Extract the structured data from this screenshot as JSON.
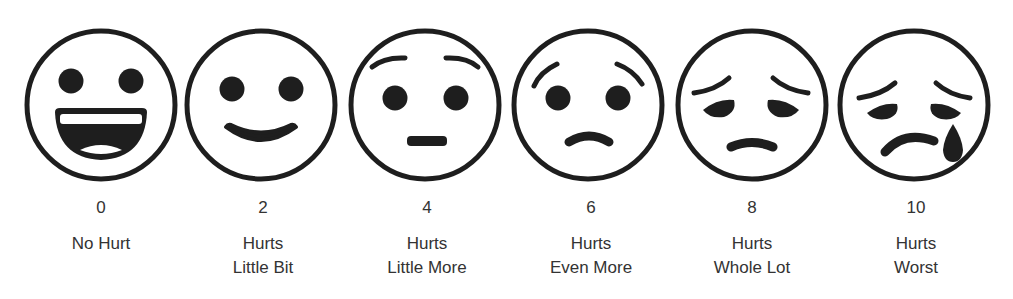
{
  "scale": {
    "title": "Pain rating face scale",
    "stroke_color": "#1e1e1e",
    "faces": [
      {
        "value": "0",
        "line1": "No Hurt",
        "line2": "",
        "expression": "big-grin"
      },
      {
        "value": "2",
        "line1": "Hurts",
        "line2": "Little Bit",
        "expression": "smile"
      },
      {
        "value": "4",
        "line1": "Hurts",
        "line2": "Little More",
        "expression": "neutral"
      },
      {
        "value": "6",
        "line1": "Hurts",
        "line2": "Even More",
        "expression": "frown"
      },
      {
        "value": "8",
        "line1": "Hurts",
        "line2": "Whole Lot",
        "expression": "sad"
      },
      {
        "value": "10",
        "line1": "Hurts",
        "line2": "Worst",
        "expression": "crying"
      }
    ]
  }
}
